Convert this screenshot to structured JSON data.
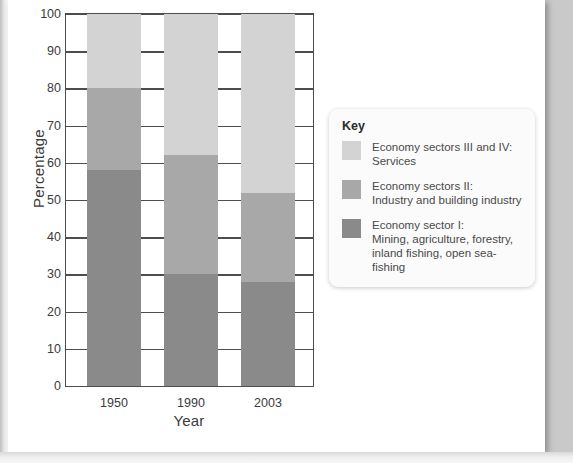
{
  "chart_data": {
    "type": "bar",
    "stacked": true,
    "title": "",
    "xlabel": "Year",
    "ylabel": "Percentage",
    "ylim": [
      0,
      100
    ],
    "yticks": [
      0,
      10,
      20,
      30,
      40,
      50,
      60,
      70,
      80,
      90,
      100
    ],
    "grid": true,
    "legend_position": "right",
    "categories": [
      "1950",
      "1990",
      "2003"
    ],
    "series": [
      {
        "name": "Economy sector I: Mining, agriculture, forestry, inland fishing, open sea-fishing",
        "color": "#8a8a8a",
        "values": [
          58,
          30,
          28
        ]
      },
      {
        "name": "Economy sectors II: Industry and building industry",
        "color": "#a8a8a8",
        "values": [
          22,
          32,
          24
        ]
      },
      {
        "name": "Economy sectors III and IV: Services",
        "color": "#d3d3d3",
        "values": [
          20,
          38,
          48
        ]
      }
    ]
  },
  "axes": {
    "y_title": "Percentage",
    "x_title": "Year",
    "y_ticks": [
      "100",
      "90",
      "80",
      "70",
      "60",
      "50",
      "40",
      "30",
      "20",
      "10",
      "0"
    ],
    "x_ticks": [
      "1950",
      "1990",
      "2003"
    ]
  },
  "legend": {
    "title": "Key",
    "items": [
      {
        "color": "#d3d3d3",
        "line1": "Economy sectors III and IV:",
        "line2": "Services",
        "line3": ""
      },
      {
        "color": "#a8a8a8",
        "line1": "Economy sectors II:",
        "line2": "Industry and building industry",
        "line3": ""
      },
      {
        "color": "#8a8a8a",
        "line1": "Economy sector I:",
        "line2": "Mining, agriculture, forestry,",
        "line3": "inland fishing, open sea-fishing"
      }
    ]
  },
  "page": {
    "caption": ""
  }
}
